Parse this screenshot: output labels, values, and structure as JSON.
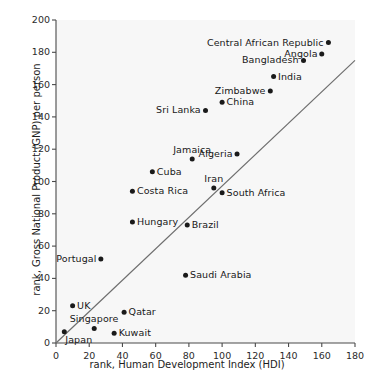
{
  "chart_data": {
    "type": "scatter",
    "title": "",
    "xlabel": "rank, Human Development Index (HDI)",
    "ylabel": "rank, Gross National Product (GNP) per person",
    "xlim": [
      0,
      180
    ],
    "ylim": [
      0,
      200
    ],
    "xticks": [
      0,
      20,
      40,
      60,
      80,
      100,
      120,
      140,
      160,
      180
    ],
    "yticks": [
      0,
      20,
      40,
      60,
      80,
      100,
      120,
      140,
      160,
      180,
      200
    ],
    "grid": false,
    "legend": "none",
    "reference_line": {
      "name": "diagonal-trend-line",
      "x0": 0,
      "y0": 0,
      "x1": 180,
      "y1": 175
    },
    "points": [
      {
        "label": "Central African Republic",
        "x": 164,
        "y": 186,
        "label_pos": "left"
      },
      {
        "label": "Angola",
        "x": 160,
        "y": 179,
        "label_pos": "left"
      },
      {
        "label": "Bangladesh",
        "x": 149,
        "y": 175,
        "label_pos": "left"
      },
      {
        "label": "India",
        "x": 131,
        "y": 165,
        "label_pos": "right"
      },
      {
        "label": "Zimbabwe",
        "x": 129,
        "y": 156,
        "label_pos": "left"
      },
      {
        "label": "China",
        "x": 100,
        "y": 149,
        "label_pos": "right"
      },
      {
        "label": "Sri Lanka",
        "x": 90,
        "y": 144,
        "label_pos": "left"
      },
      {
        "label": "Algeria",
        "x": 109,
        "y": 117,
        "label_pos": "left"
      },
      {
        "label": "Jamaica",
        "x": 82,
        "y": 114,
        "label_pos": "top"
      },
      {
        "label": "Cuba",
        "x": 58,
        "y": 106,
        "label_pos": "right"
      },
      {
        "label": "Iran",
        "x": 95,
        "y": 96,
        "label_pos": "top"
      },
      {
        "label": "Costa Rica",
        "x": 46,
        "y": 94,
        "label_pos": "right"
      },
      {
        "label": "South Africa",
        "x": 100,
        "y": 93,
        "label_pos": "right"
      },
      {
        "label": "Hungary",
        "x": 46,
        "y": 75,
        "label_pos": "right"
      },
      {
        "label": "Brazil",
        "x": 79,
        "y": 73,
        "label_pos": "right"
      },
      {
        "label": "Portugal",
        "x": 27,
        "y": 52,
        "label_pos": "left"
      },
      {
        "label": "Saudi Arabia",
        "x": 78,
        "y": 42,
        "label_pos": "right"
      },
      {
        "label": "UK",
        "x": 10,
        "y": 23,
        "label_pos": "right"
      },
      {
        "label": "Qatar",
        "x": 41,
        "y": 19,
        "label_pos": "right"
      },
      {
        "label": "Singapore",
        "x": 23,
        "y": 9,
        "label_pos": "top"
      },
      {
        "label": "Japan",
        "x": 5,
        "y": 7,
        "label_pos": "bottom-right"
      },
      {
        "label": "Kuwait",
        "x": 35,
        "y": 6,
        "label_pos": "right"
      }
    ]
  },
  "axes": {
    "x_title": "rank, Human Development Index (HDI)",
    "y_title": "rank, Gross National Product (GNP) per person",
    "x_tick_labels": [
      "0",
      "20",
      "40",
      "60",
      "80",
      "100",
      "120",
      "140",
      "160",
      "180"
    ],
    "y_tick_labels": [
      "0",
      "20",
      "40",
      "60",
      "80",
      "100",
      "120",
      "140",
      "160",
      "180",
      "200"
    ]
  },
  "colors": {
    "plot_background": "#f7f7f7",
    "page_background": "#ffffff",
    "axis": "#4a4a4a",
    "dot": "#1a1a1a",
    "trend_line": "#6e6e6e",
    "text": "#1d1d1d"
  }
}
